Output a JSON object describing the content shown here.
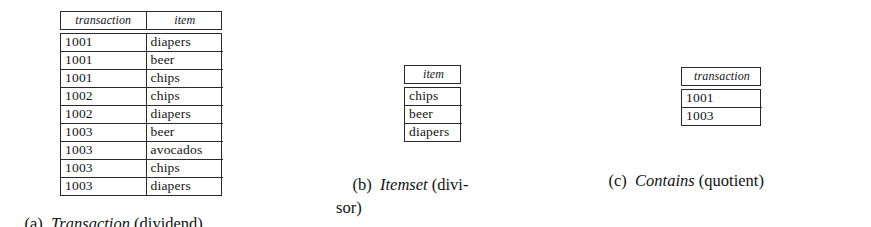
{
  "figure": {
    "background_color": "#ffffff",
    "rule_color": "#2a2a2a",
    "text_color": "#141414"
  },
  "subfigures": [
    {
      "id": "a",
      "tag": "(a)",
      "relation_name": "Transaction",
      "role": "(dividend)",
      "caption_line1": "(a)  Transaction (dividend)",
      "columns": [
        "transaction",
        "item"
      ],
      "rows": [
        [
          "1001",
          "diapers"
        ],
        [
          "1001",
          "beer"
        ],
        [
          "1001",
          "chips"
        ],
        [
          "1002",
          "chips"
        ],
        [
          "1002",
          "diapers"
        ],
        [
          "1003",
          "beer"
        ],
        [
          "1003",
          "avocados"
        ],
        [
          "1003",
          "chips"
        ],
        [
          "1003",
          "diapers"
        ]
      ]
    },
    {
      "id": "b",
      "tag": "(b)",
      "relation_name": "Itemset",
      "role": "(divi-",
      "role_continuation": "sor)",
      "caption_line1": "(b)  Itemset (divi-",
      "caption_line2": "sor)",
      "columns": [
        "item"
      ],
      "rows": [
        [
          "chips"
        ],
        [
          "beer"
        ],
        [
          "diapers"
        ]
      ]
    },
    {
      "id": "c",
      "tag": "(c)",
      "relation_name": "Contains",
      "role": "(quotient)",
      "caption_line1": "(c)  Contains (quotient)",
      "columns": [
        "transaction"
      ],
      "rows": [
        [
          "1001"
        ],
        [
          "1003"
        ]
      ]
    }
  ]
}
